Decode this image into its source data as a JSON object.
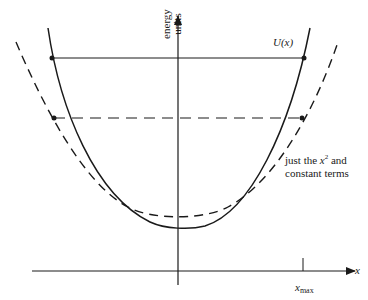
{
  "diagram": {
    "y_axis_label_line1": "energy",
    "y_axis_label_line2": "units",
    "curve_label": "U(x)",
    "dashed_note_part1": "just the ",
    "dashed_note_var": "x",
    "dashed_note_sup": "2",
    "dashed_note_part2": " and",
    "dashed_note_line2": "constant terms",
    "x_axis_label": "x",
    "x_max_var": "x",
    "x_max_sub": "max",
    "colors": {
      "line": "#1a1a1a",
      "background": "#ffffff"
    },
    "elements": {
      "solid_curve": "potential energy U(x), asymmetric well",
      "dashed_curve": "parabolic approximation (x^2 and constant terms)",
      "solid_level": "energy level line touching U(x)",
      "dashed_level": "energy level line touching parabola",
      "x_max_tick": "tick at x_max on x axis"
    }
  }
}
